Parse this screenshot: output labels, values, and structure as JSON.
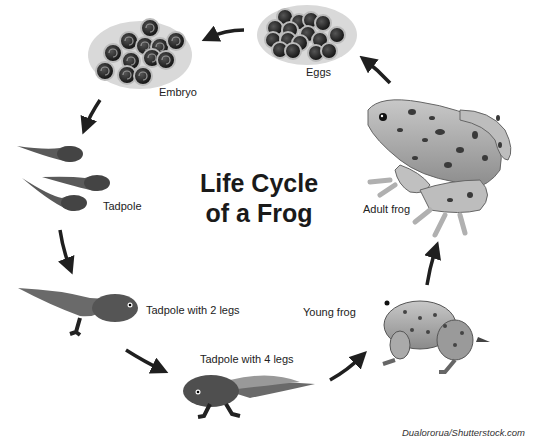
{
  "title": {
    "line1": "Life Cycle",
    "line2": "of a Frog"
  },
  "stages": [
    {
      "id": "eggs",
      "label": "Eggs"
    },
    {
      "id": "embryo",
      "label": "Embryo"
    },
    {
      "id": "tadpole",
      "label": "Tadpole"
    },
    {
      "id": "tadpole-2-legs",
      "label": "Tadpole with 2 legs"
    },
    {
      "id": "tadpole-4-legs",
      "label": "Tadpole with 4 legs"
    },
    {
      "id": "young-frog",
      "label": "Young frog"
    },
    {
      "id": "adult-frog",
      "label": "Adult frog"
    }
  ],
  "credit": "Dualororua/Shutterstock.com",
  "colors": {
    "ink": "#1f1f1f",
    "body": "#8c8c8c",
    "skin": "#b5b5b5",
    "spots": "#3a3a3a"
  }
}
